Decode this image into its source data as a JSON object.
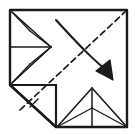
{
  "figure": {
    "title": "Origami fold step diagram",
    "type": "line-drawing",
    "canvas": {
      "width": 135,
      "height": 135
    },
    "colors": {
      "background": "#ffffff",
      "stroke": "#1a1a1a",
      "stroke_light": "#3a3a3a"
    },
    "stroke_widths": {
      "outline": 2.4,
      "crease": 1.6,
      "thin": 1.2,
      "dashed": 1.6,
      "arrow": 2.0
    },
    "dash_pattern": "6,4",
    "shapes": {
      "sheet_outline": {
        "label": "paper-outline",
        "points": "10,10 127,10 127,127 56,127 10,85"
      },
      "left_flap": {
        "label": "left-flap",
        "upper_edge": "12,12 51,47",
        "lower_edge": "12,83 51,47",
        "center_crease": "10,47 51,47",
        "inner_upper": "31,32 51,47",
        "inner_lower": "31,63 51,47",
        "spine_upper": "31,32 12,12",
        "spine_lower": "31,63 12,83"
      },
      "bottom_flap": {
        "label": "bottom-flap",
        "left_edge": "57,127 92,88",
        "right_edge": "127,127 92,88",
        "center_crease": "92,127 92,88",
        "inner_left": "57,127 92,108",
        "inner_right": "127,127 92,108",
        "spine": "92,108 92,88"
      },
      "corner_fold": {
        "label": "folded-corner",
        "horizontal_edge": "10,85 56,85",
        "vertical_edge": "56,85 56,127",
        "diagonal_edge": "10,85 56,127",
        "tick": "30,107 38,99"
      },
      "dashed_valley_line": {
        "label": "valley-fold-dashed",
        "points": "20,110 126,11"
      },
      "fold_arrow": {
        "label": "fold-direction-arrow",
        "path": "M 56,20 C 76,42 92,58 110,72",
        "head": "110,76 110,62 98,70"
      }
    },
    "legend": {
      "solid_line": "edge / existing crease",
      "dashed_line": "valley fold line",
      "arrow": "fold direction"
    }
  }
}
